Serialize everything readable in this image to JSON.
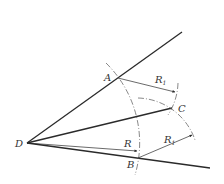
{
  "diagram": {
    "type": "geometric-construction",
    "colors": {
      "line": "#2a2a2a",
      "arc": "#555555",
      "text": "#333333",
      "background": "#ffffff"
    },
    "points": {
      "D": {
        "label": "D",
        "x": 27,
        "y": 143
      },
      "A": {
        "label": "A",
        "x": 117,
        "y": 78
      },
      "B": {
        "label": "B",
        "x": 138,
        "y": 158
      },
      "C": {
        "label": "C",
        "x": 172,
        "y": 108
      }
    },
    "radius_labels": {
      "R": "R",
      "R1_top": {
        "main": "R",
        "sub": "1"
      },
      "R1_bottom": {
        "main": "R",
        "sub": "1"
      }
    }
  }
}
